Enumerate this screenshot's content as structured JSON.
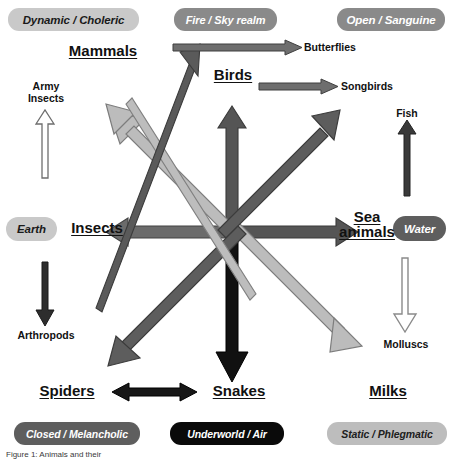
{
  "diagram": {
    "colors": {
      "dark_arrow": "#4a4a4a",
      "black_arrow": "#111111",
      "light_arrow": "#b8b8b8",
      "mid_arrow": "#8f8f8f",
      "outline_arrow": "#7d7d7d",
      "badge_light": "#c9c9c9",
      "badge_mid": "#8a8a8a",
      "badge_dark": "#5e5e5e",
      "badge_black": "#0a0a0a"
    }
  },
  "corner_badges": [
    {
      "id": "top-left",
      "label": "Dynamic / Choleric",
      "style": "light"
    },
    {
      "id": "top-center",
      "label": "Fire / Sky realm",
      "style": "mid"
    },
    {
      "id": "top-right",
      "label": "Open / Sanguine",
      "style": "mid"
    },
    {
      "id": "left",
      "label": "Earth",
      "style": "light"
    },
    {
      "id": "right",
      "label": "Water",
      "style": "dark"
    },
    {
      "id": "bottom-left",
      "label": "Closed / Melancholic",
      "style": "dark"
    },
    {
      "id": "bottom-center",
      "label": "Underworld / Air",
      "style": "black"
    },
    {
      "id": "bottom-right",
      "label": "Static / Phlegmatic",
      "style": "midlight"
    }
  ],
  "nodes": {
    "mammals": "Mammals",
    "birds": "Birds",
    "insects": "Insects",
    "sea_animals_line1": "Sea",
    "sea_animals_line2": "animals",
    "spiders": "Spiders",
    "snakes": "Snakes",
    "milks": "Milks"
  },
  "leaves": {
    "army_insects_line1": "Army",
    "army_insects_line2": "Insects",
    "butterflies": "Butterflies",
    "songbirds": "Songbirds",
    "fish": "Fish",
    "arthropods": "Arthropods",
    "molluscs": "Molluscs"
  },
  "caption": "Figure 1: Animals and their "
}
